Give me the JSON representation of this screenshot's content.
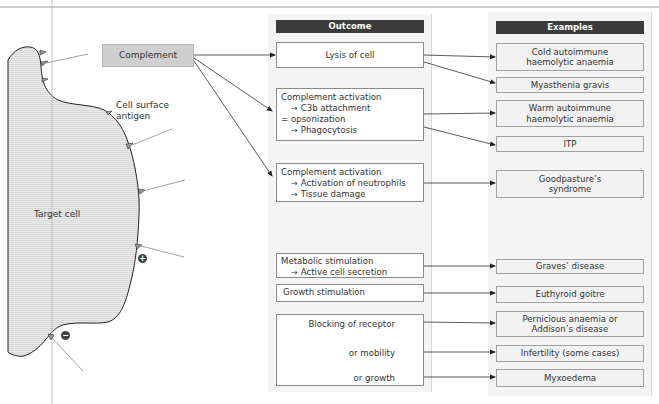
{
  "complement": {
    "label": "Complement"
  },
  "cell": {
    "target_label": "Target cell",
    "antigen_label_line1": "Cell surface",
    "antigen_label_line2": "antigen",
    "plus_sign": "+",
    "minus_sign": "−"
  },
  "outcome": {
    "header": "Outcome",
    "lysis": {
      "line1": "Lysis of cell"
    },
    "opsonization": {
      "line1": "Complement activation",
      "line2_arrow": "→",
      "line2": "C3b attachment",
      "line3": "=  opsonization",
      "line4_arrow": "→",
      "line4": "Phagocytosis"
    },
    "neutrophils": {
      "line1": "Complement activation",
      "line2_arrow": "→",
      "line2": "Activation of neutrophils",
      "line3_arrow": "→",
      "line3": "Tissue damage"
    },
    "metabolic": {
      "line1": "Metabolic stimulation",
      "line2_arrow": "→",
      "line2": "Active cell secretion"
    },
    "growth": {
      "line1": "Growth stimulation"
    },
    "blocking": {
      "line1": "Blocking of receptor",
      "line2": "or mobility",
      "line3": "or growth"
    }
  },
  "examples": {
    "header": "Examples",
    "items": [
      {
        "line1": "Cold autoimmune",
        "line2": "haemolytic anaemia"
      },
      {
        "line1": "Myasthenia gravis"
      },
      {
        "line1": "Warm autoimmune",
        "line2": "haemolytic anaemia"
      },
      {
        "line1": "ITP"
      },
      {
        "line1": "Goodpasture’s",
        "line2": "syndrome"
      },
      {
        "line1": "Graves’ disease"
      },
      {
        "line1": "Euthyroid goitre"
      },
      {
        "line1": "Pernicious anaemia or",
        "line2": "Addison’s disease"
      },
      {
        "line1": "Infertility (some cases)"
      },
      {
        "line1": "Myxoedema"
      }
    ]
  },
  "colors": {
    "header_bg": "#3c3c3c",
    "complement_bg": "#cfcfcf",
    "cell_fill": "#e6e6e6",
    "panel_bg": "#f4f4f4"
  }
}
